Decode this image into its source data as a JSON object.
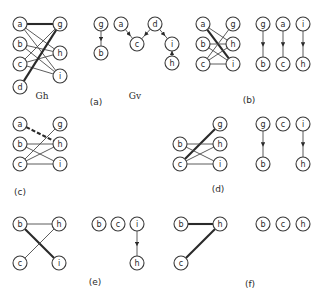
{
  "figure": {
    "node_radius": 7,
    "colors": {
      "stroke": "#3a3a3a",
      "text": "#2a2a2a",
      "background": "#ffffff"
    },
    "panels": [
      {
        "id": "a-gh",
        "caption": "",
        "graph_label": "Gh",
        "graph_label_pos": [
          42,
          99
        ],
        "nodes": [
          {
            "id": "a",
            "x": 20,
            "y": 24
          },
          {
            "id": "b",
            "x": 20,
            "y": 44
          },
          {
            "id": "c",
            "x": 20,
            "y": 64
          },
          {
            "id": "d",
            "x": 20,
            "y": 87
          },
          {
            "id": "g",
            "x": 60,
            "y": 24
          },
          {
            "id": "h",
            "x": 60,
            "y": 53
          },
          {
            "id": "i",
            "x": 60,
            "y": 76
          }
        ],
        "edges": [
          {
            "from": "a",
            "to": "g",
            "style": "thick"
          },
          {
            "from": "a",
            "to": "h",
            "style": "thin"
          },
          {
            "from": "a",
            "to": "i",
            "style": "thin"
          },
          {
            "from": "b",
            "to": "h",
            "style": "thin"
          },
          {
            "from": "b",
            "to": "i",
            "style": "thin"
          },
          {
            "from": "c",
            "to": "g",
            "style": "thin"
          },
          {
            "from": "c",
            "to": "h",
            "style": "thin"
          },
          {
            "from": "c",
            "to": "i",
            "style": "thin"
          },
          {
            "from": "d",
            "to": "g",
            "style": "thick"
          }
        ]
      },
      {
        "id": "a-gv",
        "caption": "(a)",
        "caption_pos": [
          96,
          105
        ],
        "graph_label": "Gv",
        "graph_label_pos": [
          135,
          99
        ],
        "nodes": [
          {
            "id": "g",
            "x": 101,
            "y": 24
          },
          {
            "id": "b",
            "x": 101,
            "y": 53
          },
          {
            "id": "a",
            "x": 121,
            "y": 24
          },
          {
            "id": "c",
            "x": 137,
            "y": 44
          },
          {
            "id": "d",
            "x": 155,
            "y": 24
          },
          {
            "id": "i",
            "x": 172,
            "y": 44
          },
          {
            "id": "h",
            "x": 172,
            "y": 63
          }
        ],
        "edges": [
          {
            "from": "g",
            "to": "b",
            "style": "arrow"
          },
          {
            "from": "a",
            "to": "c",
            "style": "arrow"
          },
          {
            "from": "d",
            "to": "c",
            "style": "arrow"
          },
          {
            "from": "d",
            "to": "i",
            "style": "arrow"
          },
          {
            "from": "h",
            "to": "i",
            "style": "arrow"
          }
        ]
      },
      {
        "id": "b",
        "caption": "(b)",
        "caption_pos": [
          249,
          103
        ],
        "nodes": [
          {
            "id": "a",
            "x": 203,
            "y": 24
          },
          {
            "id": "b",
            "x": 203,
            "y": 44
          },
          {
            "id": "c",
            "x": 203,
            "y": 64
          },
          {
            "id": "g",
            "x": 233,
            "y": 24
          },
          {
            "id": "h",
            "x": 233,
            "y": 44
          },
          {
            "id": "i",
            "x": 233,
            "y": 64
          },
          {
            "id": "g",
            "x": 263,
            "y": 24
          },
          {
            "id": "b",
            "x": 263,
            "y": 64
          },
          {
            "id": "a",
            "x": 283,
            "y": 24
          },
          {
            "id": "c",
            "x": 283,
            "y": 64
          },
          {
            "id": "i",
            "x": 303,
            "y": 24
          },
          {
            "id": "h",
            "x": 303,
            "y": 64
          }
        ],
        "edges": [
          {
            "from": 0,
            "to": 5,
            "style": "thick"
          },
          {
            "from": 0,
            "to": 4,
            "style": "thin"
          },
          {
            "from": 1,
            "to": 4,
            "style": "thin"
          },
          {
            "from": 1,
            "to": 5,
            "style": "thin"
          },
          {
            "from": 2,
            "to": 3,
            "style": "thin"
          },
          {
            "from": 2,
            "to": 4,
            "style": "thin"
          },
          {
            "from": 2,
            "to": 5,
            "style": "thin"
          },
          {
            "from": 6,
            "to": 7,
            "style": "arrow"
          },
          {
            "from": 8,
            "to": 9,
            "style": "arrow"
          },
          {
            "from": 10,
            "to": 11,
            "style": "arrow"
          }
        ]
      },
      {
        "id": "c",
        "caption": "(c)",
        "caption_pos": [
          20,
          195
        ],
        "nodes": [
          {
            "id": "a",
            "x": 20,
            "y": 124
          },
          {
            "id": "b",
            "x": 20,
            "y": 144
          },
          {
            "id": "c",
            "x": 20,
            "y": 164
          },
          {
            "id": "g",
            "x": 60,
            "y": 124
          },
          {
            "id": "h",
            "x": 60,
            "y": 144
          },
          {
            "id": "i",
            "x": 60,
            "y": 164
          }
        ],
        "edges": [
          {
            "from": 0,
            "to": 4,
            "style": "dashed"
          },
          {
            "from": 1,
            "to": 4,
            "style": "thin"
          },
          {
            "from": 1,
            "to": 5,
            "style": "thin"
          },
          {
            "from": 2,
            "to": 3,
            "style": "thin"
          },
          {
            "from": 2,
            "to": 4,
            "style": "thin"
          },
          {
            "from": 2,
            "to": 5,
            "style": "thin"
          }
        ]
      },
      {
        "id": "d",
        "caption": "(d)",
        "caption_pos": [
          218,
          192
        ],
        "nodes": [
          {
            "id": "g",
            "x": 220,
            "y": 124
          },
          {
            "id": "b",
            "x": 180,
            "y": 144
          },
          {
            "id": "h",
            "x": 220,
            "y": 144
          },
          {
            "id": "c",
            "x": 180,
            "y": 164
          },
          {
            "id": "i",
            "x": 220,
            "y": 164
          },
          {
            "id": "g",
            "x": 263,
            "y": 124
          },
          {
            "id": "b",
            "x": 263,
            "y": 164
          },
          {
            "id": "c",
            "x": 283,
            "y": 124
          },
          {
            "id": "i",
            "x": 303,
            "y": 124
          },
          {
            "id": "h",
            "x": 303,
            "y": 164
          }
        ],
        "edges": [
          {
            "from": 3,
            "to": 0,
            "style": "thick"
          },
          {
            "from": 1,
            "to": 2,
            "style": "thin"
          },
          {
            "from": 1,
            "to": 4,
            "style": "thin"
          },
          {
            "from": 3,
            "to": 2,
            "style": "thin"
          },
          {
            "from": 3,
            "to": 4,
            "style": "thin"
          },
          {
            "from": 5,
            "to": 6,
            "style": "arrow"
          },
          {
            "from": 8,
            "to": 9,
            "style": "arrow"
          }
        ]
      },
      {
        "id": "e",
        "caption": "(e)",
        "caption_pos": [
          95,
          285
        ],
        "nodes": [
          {
            "id": "b",
            "x": 20,
            "y": 224
          },
          {
            "id": "h",
            "x": 59,
            "y": 224
          },
          {
            "id": "c",
            "x": 20,
            "y": 263
          },
          {
            "id": "i",
            "x": 59,
            "y": 263
          },
          {
            "id": "b",
            "x": 99,
            "y": 224
          },
          {
            "id": "c",
            "x": 118,
            "y": 224
          },
          {
            "id": "i",
            "x": 137,
            "y": 224
          },
          {
            "id": "h",
            "x": 137,
            "y": 263
          }
        ],
        "edges": [
          {
            "from": 0,
            "to": 1,
            "style": "thin"
          },
          {
            "from": 0,
            "to": 3,
            "style": "thick"
          },
          {
            "from": 2,
            "to": 1,
            "style": "thin"
          },
          {
            "from": 6,
            "to": 7,
            "style": "arrow"
          }
        ]
      },
      {
        "id": "f",
        "caption": "(f)",
        "caption_pos": [
          250,
          287
        ],
        "nodes": [
          {
            "id": "b",
            "x": 181,
            "y": 224
          },
          {
            "id": "h",
            "x": 220,
            "y": 224
          },
          {
            "id": "c",
            "x": 181,
            "y": 263
          },
          {
            "id": "b",
            "x": 263,
            "y": 224
          },
          {
            "id": "c",
            "x": 283,
            "y": 224
          },
          {
            "id": "h",
            "x": 303,
            "y": 224
          }
        ],
        "edges": [
          {
            "from": 0,
            "to": 1,
            "style": "thick"
          },
          {
            "from": 2,
            "to": 1,
            "style": "thick"
          }
        ]
      }
    ]
  }
}
